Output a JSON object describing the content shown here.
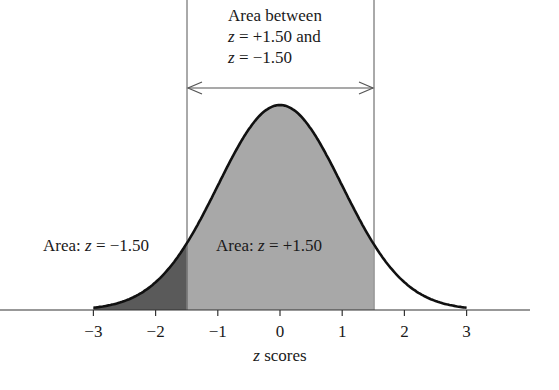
{
  "chart_data": {
    "type": "area",
    "title": "",
    "xlabel": "z scores",
    "ylabel": "",
    "xlim": [
      -3,
      3
    ],
    "x_ticks": [
      "−3",
      "−2",
      "−1",
      "0",
      "1",
      "2",
      "3"
    ],
    "x_tick_values": [
      -3,
      -2,
      -1,
      0,
      1,
      2,
      3
    ],
    "grid": false,
    "legend": null,
    "curve": {
      "distribution": "normal",
      "mean": 0,
      "sd": 1
    },
    "shaded_regions": [
      {
        "name": "Area: z = −1.50",
        "from": -3,
        "to": -1.5,
        "color": "#5a5a5a"
      },
      {
        "name": "Area: z = +1.50",
        "from": -1.5,
        "to": 1.5,
        "color": "#a8a8a8"
      }
    ],
    "vertical_lines": [
      -1.5,
      1.5
    ],
    "annotations": [
      {
        "text": "Area between z = +1.50 and z = −1.50",
        "type": "double-arrow",
        "from": -1.5,
        "to": 1.5
      },
      {
        "text": "Area: z = −1.50",
        "position": "left tail"
      },
      {
        "text": "Area: z = +1.50",
        "position": "center"
      }
    ]
  },
  "labels": {
    "top_line1": "Area between",
    "top_line2_var": "z",
    "top_line2_rest": " = +1.50 and",
    "top_line3_var": "z",
    "top_line3_rest": " = −1.50",
    "left_prefix": "Area: ",
    "left_var": "z",
    "left_rest": " = −1.50",
    "center_prefix": "Area: ",
    "center_var": "z",
    "center_rest": " = +1.50",
    "xlabel_var": "z",
    "xlabel_rest": " scores"
  },
  "colors": {
    "tail_fill": "#5a5a5a",
    "center_fill": "#a8a8a8",
    "curve": "#111111",
    "axis": "#333333",
    "guide_lines": "#555555",
    "arrow": "#555555"
  }
}
